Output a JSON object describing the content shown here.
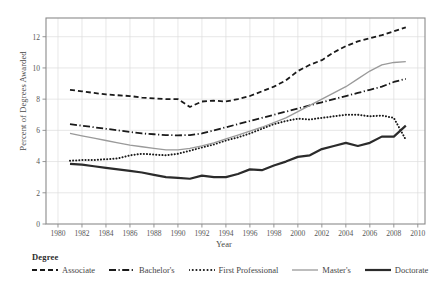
{
  "chart_data": {
    "type": "line",
    "title": "",
    "xlabel": "Year",
    "ylabel": "Percent of Degrees Awarded",
    "xlim": [
      1979,
      2010.6
    ],
    "ylim": [
      0,
      13.2
    ],
    "grid": true,
    "legend_position": "below",
    "legend_title": "Degree",
    "xticks": [
      1980,
      1982,
      1984,
      1986,
      1988,
      1990,
      1992,
      1994,
      1996,
      1998,
      2000,
      2002,
      2004,
      2006,
      2008,
      2010
    ],
    "yticks": [
      0,
      2,
      4,
      6,
      8,
      10,
      12
    ],
    "x": [
      1981,
      1982,
      1983,
      1984,
      1985,
      1986,
      1987,
      1988,
      1989,
      1990,
      1991,
      1992,
      1993,
      1994,
      1995,
      1996,
      1997,
      1998,
      1999,
      2000,
      2001,
      2002,
      2003,
      2004,
      2005,
      2006,
      2007,
      2008,
      2009
    ],
    "series": [
      {
        "name": "Associate",
        "style": "dashed",
        "color": "#1a1a1a",
        "width": 1.8,
        "values": [
          8.6,
          8.5,
          8.4,
          8.3,
          8.25,
          8.2,
          8.1,
          8.05,
          8.0,
          8.0,
          7.5,
          7.85,
          7.9,
          7.85,
          8.0,
          8.2,
          8.5,
          8.8,
          9.2,
          9.8,
          10.2,
          10.5,
          11.0,
          11.4,
          11.7,
          11.9,
          12.1,
          12.35,
          12.6
        ]
      },
      {
        "name": "Bachelor's",
        "style": "dashdot",
        "color": "#1a1a1a",
        "width": 1.8,
        "values": [
          6.4,
          6.3,
          6.2,
          6.1,
          6.0,
          5.9,
          5.8,
          5.75,
          5.7,
          5.68,
          5.7,
          5.8,
          6.0,
          6.2,
          6.4,
          6.6,
          6.8,
          7.0,
          7.2,
          7.4,
          7.6,
          7.8,
          8.0,
          8.2,
          8.4,
          8.6,
          8.8,
          9.1,
          9.3
        ]
      },
      {
        "name": "First Professional",
        "style": "dotted",
        "color": "#1a1a1a",
        "width": 2.0,
        "values": [
          4.05,
          4.1,
          4.1,
          4.15,
          4.2,
          4.4,
          4.5,
          4.45,
          4.4,
          4.5,
          4.7,
          4.9,
          5.1,
          5.35,
          5.55,
          5.8,
          6.1,
          6.4,
          6.6,
          6.75,
          6.7,
          6.8,
          6.9,
          7.0,
          7.0,
          6.9,
          6.95,
          6.8,
          5.4
        ]
      },
      {
        "name": "Master's",
        "style": "solid",
        "color": "#9a9a9a",
        "width": 1.3,
        "values": [
          5.8,
          5.65,
          5.5,
          5.35,
          5.2,
          5.05,
          4.95,
          4.85,
          4.75,
          4.75,
          4.85,
          5.0,
          5.2,
          5.45,
          5.7,
          5.95,
          6.2,
          6.5,
          6.8,
          7.2,
          7.6,
          8.0,
          8.4,
          8.8,
          9.3,
          9.8,
          10.2,
          10.35,
          10.4
        ]
      },
      {
        "name": "Doctorate",
        "style": "solid",
        "color": "#2b2b2b",
        "width": 2.2,
        "values": [
          3.85,
          3.8,
          3.7,
          3.6,
          3.5,
          3.4,
          3.3,
          3.15,
          3.0,
          2.95,
          2.9,
          3.1,
          3.0,
          3.0,
          3.2,
          3.5,
          3.45,
          3.75,
          4.0,
          4.3,
          4.4,
          4.8,
          5.0,
          5.2,
          5.0,
          5.2,
          5.6,
          5.6,
          6.3
        ]
      }
    ]
  },
  "axes": {
    "ylabel": "Percent of Degrees Awarded",
    "xlabel": "Year"
  },
  "legend": {
    "title": "Degree",
    "entries": [
      {
        "label": "Associate",
        "icon": "dashed-line-icon"
      },
      {
        "label": "Bachelor's",
        "icon": "dashdot-line-icon"
      },
      {
        "label": "First Professional",
        "icon": "dotted-line-icon"
      },
      {
        "label": "Master's",
        "icon": "thin-solid-line-icon"
      },
      {
        "label": "Doctorate",
        "icon": "thick-solid-line-icon"
      }
    ]
  }
}
